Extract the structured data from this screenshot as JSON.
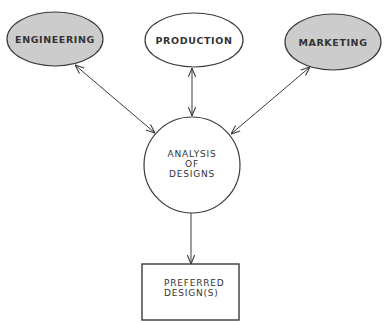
{
  "diagram": {
    "nodes": [
      {
        "id": "engineering",
        "label": "ENGINEERING",
        "shape": "ellipse",
        "fill": "#cccccc"
      },
      {
        "id": "production",
        "label": "PRODUCTION",
        "shape": "ellipse",
        "fill": "#ffffff"
      },
      {
        "id": "marketing",
        "label": "MARKETING",
        "shape": "ellipse",
        "fill": "#cccccc"
      },
      {
        "id": "analysis",
        "label_lines": [
          "ANALYSIS",
          "OF",
          "DESIGNS"
        ],
        "shape": "circle",
        "fill": "#ffffff"
      },
      {
        "id": "preferred",
        "label_lines": [
          "PREFERRED",
          "DESIGN(S)"
        ],
        "shape": "rectangle",
        "fill": "#ffffff"
      }
    ],
    "edges": [
      {
        "from": "engineering",
        "to": "analysis",
        "bidirectional": true
      },
      {
        "from": "production",
        "to": "analysis",
        "bidirectional": true
      },
      {
        "from": "marketing",
        "to": "analysis",
        "bidirectional": true
      },
      {
        "from": "analysis",
        "to": "preferred",
        "bidirectional": false
      }
    ],
    "colors": {
      "stroke": "#3a3a3a",
      "shaded_fill": "#cccccc",
      "text": "#333333"
    }
  }
}
